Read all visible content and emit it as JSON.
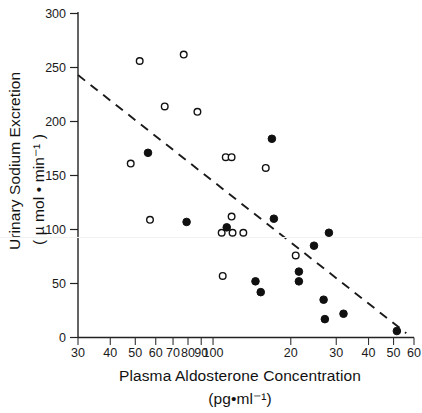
{
  "figure": {
    "name": "scatter-plot-figure",
    "width": 422,
    "height": 413,
    "background": "#ffffff"
  },
  "chart_data": {
    "type": "scatter",
    "title": "",
    "xlabel": "Plasma Aldosterone Concentration",
    "xlabel_units": "(pg•ml⁻¹)",
    "ylabel": "Urinary Sodium Excretion",
    "ylabel_units": "( µ mol • min⁻¹ )",
    "xscale": "log",
    "yscale": "linear",
    "xlim": [
      30,
      600
    ],
    "ylim": [
      0,
      300
    ],
    "grid": false,
    "legend_position": "none",
    "x_tick_labels": [
      "30",
      "40",
      "50",
      "60",
      "70",
      "80",
      "90",
      "100",
      "20",
      "30",
      "40",
      "50",
      "60"
    ],
    "x_tick_values": [
      30,
      40,
      50,
      60,
      70,
      80,
      90,
      100,
      200,
      300,
      400,
      500,
      600
    ],
    "y_tick_labels": [
      "0",
      "50",
      "100",
      "150",
      "200",
      "250",
      "300"
    ],
    "y_tick_values": [
      0,
      50,
      100,
      150,
      200,
      250,
      300
    ],
    "marker_styles": {
      "open_circle": "open circle — unfilled marker",
      "filled_circle": "filled circle — solid black marker"
    },
    "series": [
      {
        "name": "open-circles",
        "marker": "open_circle",
        "points": [
          {
            "x": 52,
            "y": 256
          },
          {
            "x": 77,
            "y": 262
          },
          {
            "x": 65,
            "y": 214
          },
          {
            "x": 87,
            "y": 209
          },
          {
            "x": 48,
            "y": 161
          },
          {
            "x": 112,
            "y": 167
          },
          {
            "x": 118,
            "y": 167
          },
          {
            "x": 160,
            "y": 157
          },
          {
            "x": 57,
            "y": 109
          },
          {
            "x": 118,
            "y": 112
          },
          {
            "x": 108,
            "y": 97
          },
          {
            "x": 119,
            "y": 97
          },
          {
            "x": 131,
            "y": 97
          },
          {
            "x": 209,
            "y": 76
          },
          {
            "x": 109,
            "y": 57
          }
        ]
      },
      {
        "name": "filled-circles",
        "marker": "filled_circle",
        "points": [
          {
            "x": 169,
            "y": 184
          },
          {
            "x": 56,
            "y": 171
          },
          {
            "x": 79,
            "y": 107
          },
          {
            "x": 172,
            "y": 110
          },
          {
            "x": 113,
            "y": 102
          },
          {
            "x": 281,
            "y": 97
          },
          {
            "x": 246,
            "y": 85
          },
          {
            "x": 215,
            "y": 61
          },
          {
            "x": 215,
            "y": 52
          },
          {
            "x": 146,
            "y": 52
          },
          {
            "x": 153,
            "y": 42
          },
          {
            "x": 268,
            "y": 35
          },
          {
            "x": 320,
            "y": 22
          },
          {
            "x": 271,
            "y": 17
          },
          {
            "x": 515,
            "y": 6
          }
        ]
      }
    ],
    "trend_line": {
      "name": "regression-line",
      "style": "dashed",
      "x_start": 30,
      "y_start": 243,
      "x_end": 560,
      "y_end": 4
    },
    "annotations": []
  }
}
